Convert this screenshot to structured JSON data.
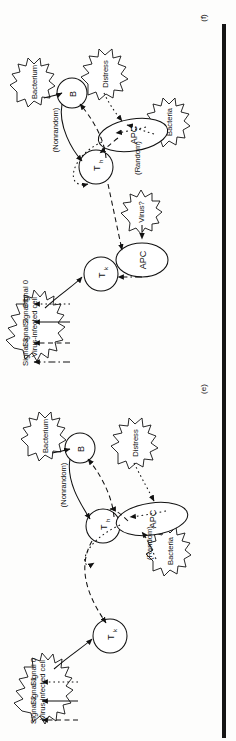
{
  "figure": {
    "type": "diagram",
    "orientation": "rotated-90-ccw"
  },
  "panels": [
    {
      "tag": "(f)",
      "id": "panel-f",
      "legend": {
        "title": "",
        "entries": [
          {
            "label": "Signal 0",
            "style": "dotted"
          },
          {
            "label": "Signal 1",
            "style": "solid"
          },
          {
            "label": "Signal 2",
            "style": "dashed"
          },
          {
            "label": "Signal 3",
            "style": "dash-dot"
          }
        ]
      },
      "nodes": [
        {
          "id": "tk",
          "label": "T",
          "sub": "k",
          "shape": "circle",
          "name": "killer-t-cell"
        },
        {
          "id": "th",
          "label": "T",
          "sub": "h",
          "shape": "circle",
          "name": "helper-t-cell"
        },
        {
          "id": "b",
          "label": "B",
          "sub": "",
          "shape": "circle",
          "name": "b-cell"
        },
        {
          "id": "apc1",
          "label": "APC",
          "sub": "",
          "shape": "ellipse",
          "name": "antigen-presenting-cell-upper"
        },
        {
          "id": "apc2",
          "label": "APC",
          "sub": "",
          "shape": "ellipse",
          "name": "antigen-presenting-cell-lower"
        }
      ],
      "stimuli": [
        {
          "id": "virus_cell",
          "label": "Virus-infected cell",
          "name": "virus-infected-cell-burst"
        },
        {
          "id": "virusq",
          "label": "Virus?",
          "name": "virus-question-burst"
        },
        {
          "id": "bacterium",
          "label": "Bacterium",
          "name": "bacterium-burst"
        },
        {
          "id": "bacteria",
          "label": "Bacteria",
          "name": "bacteria-burst"
        },
        {
          "id": "distress",
          "label": "Distress",
          "name": "distress-burst"
        }
      ],
      "edge_labels": [
        {
          "id": "nonrandom",
          "label": "(Nonrandom)"
        },
        {
          "id": "random",
          "label": "(Random)"
        }
      ]
    },
    {
      "tag": "(e)",
      "id": "panel-e",
      "legend": {
        "title": "",
        "entries": [
          {
            "label": "Signal 0",
            "style": "dotted"
          },
          {
            "label": "Signal 1",
            "style": "solid"
          },
          {
            "label": "Signal 2",
            "style": "dashed"
          }
        ]
      },
      "nodes": [
        {
          "id": "tk",
          "label": "T",
          "sub": "k",
          "shape": "circle",
          "name": "killer-t-cell"
        },
        {
          "id": "th",
          "label": "T",
          "sub": "h",
          "shape": "circle",
          "name": "helper-t-cell"
        },
        {
          "id": "b",
          "label": "B",
          "sub": "",
          "shape": "circle",
          "name": "b-cell"
        },
        {
          "id": "apc",
          "label": "APC",
          "sub": "",
          "shape": "ellipse",
          "name": "antigen-presenting-cell"
        }
      ],
      "stimuli": [
        {
          "id": "virus_cell",
          "label": "Virus-infected cell",
          "name": "virus-infected-cell-burst"
        },
        {
          "id": "bacterium",
          "label": "Bacterium",
          "name": "bacterium-burst"
        },
        {
          "id": "bacteria",
          "label": "Bacteria",
          "name": "bacteria-burst"
        },
        {
          "id": "distress",
          "label": "Distress",
          "name": "distress-burst"
        }
      ],
      "edge_labels": [
        {
          "id": "nonrandom",
          "label": "(Nonrandom)"
        },
        {
          "id": "random",
          "label": "(Random)"
        }
      ]
    }
  ],
  "colors": {
    "ink": "#111111",
    "paper": "#fdfdfc",
    "edge_bar": "#151515"
  }
}
